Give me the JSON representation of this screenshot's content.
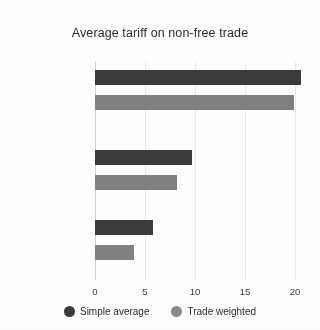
{
  "chart_data": {
    "type": "bar",
    "orientation": "horizontal",
    "title": "Average tariff on non-free trade",
    "xlabel": "",
    "ylabel": "",
    "categories": [
      "Agriculture",
      "Manufacturing",
      "Natural resources"
    ],
    "series": [
      {
        "name": "Simple average",
        "color": "#3b3b3b",
        "values": [
          20.6,
          9.7,
          5.8
        ]
      },
      {
        "name": "Trade weighted",
        "color": "#808080",
        "values": [
          19.9,
          8.2,
          3.9
        ]
      }
    ],
    "xlim": [
      0,
      20.6
    ],
    "xticks": [
      0,
      5,
      10,
      15,
      20
    ],
    "xtick_labels": [
      "0",
      "5",
      "10",
      "15",
      "20"
    ],
    "grid": true,
    "grid_axis": "x",
    "legend_position": "bottom-center"
  },
  "legend": {
    "items": [
      {
        "label": "Simple average",
        "color": "#3b3b3b"
      },
      {
        "label": "Trade weighted",
        "color": "#8a8a8a"
      }
    ]
  }
}
